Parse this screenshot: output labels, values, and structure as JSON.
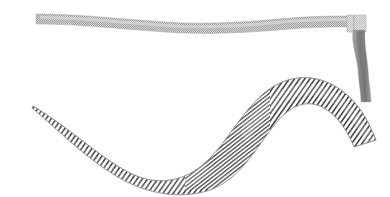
{
  "figure": {
    "canvas": {
      "width": 390,
      "height": 197,
      "background": "#ffffff"
    },
    "palette": {
      "background": "#ffffff",
      "hatch_line": "#4f4f4f",
      "hatch_line_light": "#7d7d7d",
      "band_fill": "#b9b9b9",
      "band_checker_dark": "#9a9a9a",
      "tail_fill": "#8d8d8d",
      "tail_shadow": "#6f6f6f",
      "cuff_fill": "#cfcfcf",
      "edge_stroke": "#a8a8a8"
    },
    "shapes": [
      {
        "id": "top-band",
        "name": "Thin horizontal textured band",
        "texture": "fine-checker-dither",
        "fill": "#b9b9b9",
        "x_start": 36,
        "x_end": 352,
        "y_start": 18,
        "y_end": 26,
        "thickness": 10,
        "wave_amplitude": 4
      },
      {
        "id": "band-cuff",
        "name": "Light rectangular cuff at band right end",
        "texture": "fine-checker-dither",
        "fill": "#cfcfcf",
        "x": 348,
        "y": 16,
        "width": 17,
        "height": 16
      },
      {
        "id": "descending-tail",
        "name": "Vertical descending tail strip",
        "texture": "smooth-vertical-gradient",
        "fill": "#8d8d8d",
        "x_top": 356,
        "y_top": 30,
        "x_bottom": 366,
        "y_bottom": 102,
        "width": 11
      },
      {
        "id": "s-ribbon",
        "name": "Large S-curved hatched ribbon",
        "texture": "diagonal-hatch",
        "hatch_angle_deg": 35,
        "hatch_spacing_px": 3,
        "stroke": "#4f4f4f",
        "x_start": 32,
        "y_start": 107,
        "x_end": 376,
        "y_end": 141,
        "crest_x": 268,
        "crest_y": 80,
        "trough_x": 150,
        "trough_y": 186,
        "thickness_start": 36,
        "thickness_mid": 40,
        "thickness_end": 46
      }
    ]
  },
  "chart_data": {
    "type": "line",
    "xlabel": "",
    "ylabel": "",
    "xlim": [
      0,
      390
    ],
    "ylim": [
      197,
      0
    ],
    "grid": false,
    "legend": "none",
    "series": [
      {
        "name": "top-band-centerline",
        "x": [
          36,
          90,
          150,
          210,
          265,
          310,
          352
        ],
        "values": [
          20,
          22,
          25,
          24,
          22,
          21,
          22
        ]
      },
      {
        "name": "descending-tail-centerline",
        "x": [
          358,
          360,
          363,
          362,
          364,
          366
        ],
        "values": [
          32,
          46,
          60,
          74,
          88,
          101
        ]
      },
      {
        "name": "s-ribbon-centerline",
        "x": [
          32,
          70,
          110,
          150,
          190,
          230,
          268,
          305,
          340,
          376
        ],
        "values": [
          125,
          148,
          168,
          180,
          173,
          140,
          100,
          88,
          100,
          122
        ]
      }
    ]
  }
}
